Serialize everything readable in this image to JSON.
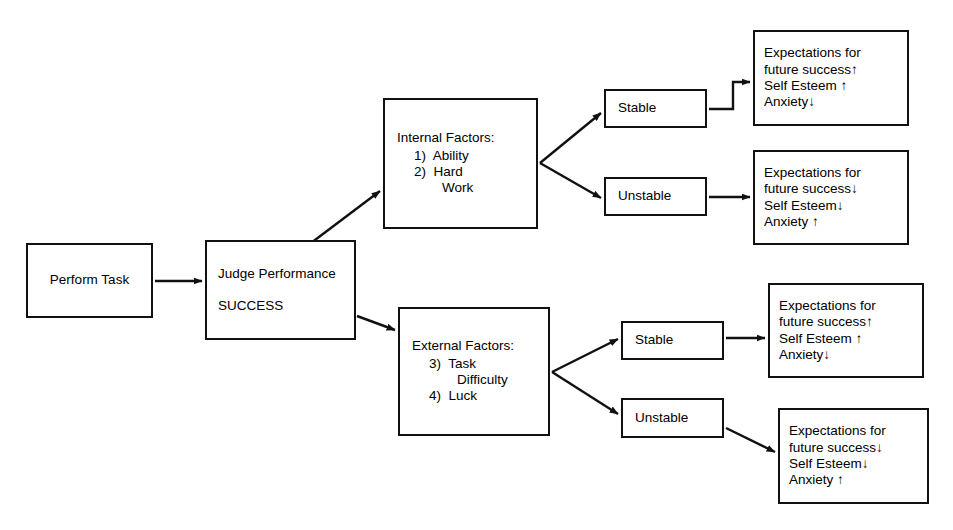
{
  "diagram": {
    "stroke_color": "#111111",
    "background_color": "#ffffff"
  },
  "nodes": {
    "perform_task": {
      "label": "Perform Task"
    },
    "judge_performance": {
      "line1": "Judge Performance",
      "line2": "SUCCESS"
    },
    "internal_factors": {
      "heading": "Internal Factors:",
      "item1": "1)  Ability",
      "item2": "2)  Hard",
      "item2_cont": "Work"
    },
    "external_factors": {
      "heading": "External Factors:",
      "item1": "3)  Task",
      "item1_cont": "Difficulty",
      "item2": "4)  Luck"
    },
    "stable_internal": {
      "label": "Stable"
    },
    "unstable_internal": {
      "label": "Unstable"
    },
    "stable_external": {
      "label": "Stable"
    },
    "unstable_external": {
      "label": "Unstable"
    }
  },
  "outcomes": [
    {
      "id": "internal-stable",
      "line1": "Expectations for",
      "line2": "future success↑",
      "line3": "Self Esteem ↑",
      "line4": "Anxiety↓"
    },
    {
      "id": "internal-unstable",
      "line1": "Expectations for",
      "line2": "future success↓",
      "line3": "Self Esteem↓",
      "line4": "Anxiety ↑"
    },
    {
      "id": "external-stable",
      "line1": "Expectations for",
      "line2": "future success↑",
      "line3": "Self Esteem ↑",
      "line4": "Anxiety↓"
    },
    {
      "id": "external-unstable",
      "line1": "Expectations for",
      "line2": "future success↓",
      "line3": "Self Esteem↓",
      "line4": "Anxiety ↑"
    }
  ],
  "connectors": [
    {
      "name": "perform-task-to-judge-performance"
    },
    {
      "name": "judge-performance-to-internal-factors"
    },
    {
      "name": "judge-performance-to-external-factors"
    },
    {
      "name": "internal-factors-to-stable"
    },
    {
      "name": "internal-factors-to-unstable"
    },
    {
      "name": "external-factors-to-stable"
    },
    {
      "name": "external-factors-to-unstable"
    },
    {
      "name": "stable-internal-to-outcome-1"
    },
    {
      "name": "unstable-internal-to-outcome-2"
    },
    {
      "name": "stable-external-to-outcome-3"
    },
    {
      "name": "unstable-external-to-outcome-4"
    }
  ]
}
